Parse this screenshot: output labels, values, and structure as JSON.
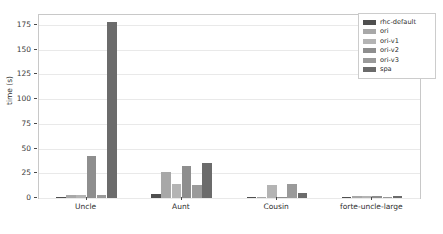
{
  "chart_data": {
    "type": "bar",
    "title": "",
    "xlabel": "",
    "ylabel": "time (s)",
    "categories": [
      "Uncle",
      "Aunt",
      "Cousin",
      "forte-uncle-large"
    ],
    "ylim": [
      0,
      185
    ],
    "yticks": [
      0,
      25,
      50,
      75,
      100,
      125,
      150,
      175
    ],
    "ytick_labels": [
      "0",
      "25",
      "50",
      "75",
      "100",
      "125",
      "150",
      "175"
    ],
    "grid": "horizontal",
    "legend_position": "upper right",
    "series": [
      {
        "name": "rhc-default",
        "color": "#4f4f4f",
        "values": [
          1.5,
          4.5,
          0.3,
          0.3
        ]
      },
      {
        "name": "ori",
        "color": "#a8a8a8",
        "values": [
          3.0,
          26.0,
          0.3,
          2.0
        ]
      },
      {
        "name": "ori-v1",
        "color": "#b4b4b4",
        "values": [
          3.0,
          14.5,
          13.0,
          2.0
        ]
      },
      {
        "name": "ori-v2",
        "color": "#8e8e8e",
        "values": [
          42.0,
          32.5,
          1.0,
          1.8
        ]
      },
      {
        "name": "ori-v3",
        "color": "#9a9a9a",
        "values": [
          3.5,
          13.5,
          14.5,
          0.4
        ]
      },
      {
        "name": "spa",
        "color": "#6b6b6b",
        "values": [
          178.0,
          35.0,
          5.5,
          2.0
        ]
      }
    ]
  },
  "figure": {
    "background_color": "#ffffff",
    "axes_edge_color": "#c8c8c8",
    "gridline_color": "#e9e9e9",
    "tick_label_color": "#3a3a3a"
  }
}
